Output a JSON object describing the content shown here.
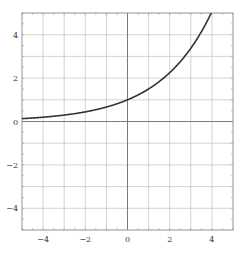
{
  "chart_data": {
    "type": "line",
    "title": "",
    "xlabel": "",
    "ylabel": "",
    "xlim": [
      -5,
      5
    ],
    "ylim": [
      -5,
      5
    ],
    "grid": true,
    "grid_step": 1,
    "x_ticks": [
      -4,
      -2,
      0,
      2,
      4
    ],
    "y_ticks": [
      -4,
      -2,
      0,
      2,
      4
    ],
    "x_tick_labels": [
      "−4",
      "−2",
      "0",
      "2",
      "4"
    ],
    "y_tick_labels": [
      "−4",
      "−2",
      "0",
      "2",
      "4"
    ],
    "series": [
      {
        "name": "f(x) = 1.5^x",
        "function": "1.5^x",
        "color": "#333333",
        "x": [
          -5,
          -4,
          -3,
          -2,
          -1,
          0,
          1,
          2,
          3,
          4
        ],
        "y": [
          0.13,
          0.2,
          0.3,
          0.44,
          0.67,
          1.0,
          1.5,
          2.25,
          3.38,
          5.06
        ]
      }
    ],
    "legend": null
  },
  "colors": {
    "grid": "#c8c8c8",
    "axis": "#7a7a7a",
    "frame": "#9a9a9a",
    "curve": "#333333",
    "background": "#ffffff"
  }
}
